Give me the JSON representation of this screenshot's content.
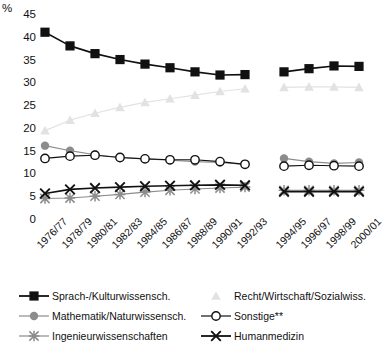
{
  "chart_data": {
    "type": "line",
    "title": "",
    "xlabel": "",
    "ylabel": "%",
    "ylim": [
      0,
      45
    ],
    "ytick_step": 5,
    "grid": false,
    "legend_position": "bottom",
    "note": "Series are broken between 1992/93 and 1994/95 (data gap)",
    "categories": [
      "1976/77",
      "1978/79",
      "1980/81",
      "1982/83",
      "1984/85",
      "1986/87",
      "1988/89",
      "1990/91",
      "1992/93",
      "1994/95",
      "1996/97",
      "1998/99",
      "2000/01"
    ],
    "yticks": [
      "0",
      "5",
      "10",
      "15",
      "20",
      "25",
      "30",
      "35",
      "40",
      "45"
    ],
    "series": [
      {
        "name": "Sprach-/Kulturwissensch.",
        "marker": "filled-square",
        "color": "#111111",
        "values": [
          41.0,
          38.0,
          36.3,
          35.0,
          34.0,
          33.2,
          32.3,
          31.6,
          31.7,
          32.3,
          33.0,
          33.6,
          33.5
        ]
      },
      {
        "name": "Recht/Wirtschaft/Sozialwiss.",
        "marker": "triangle",
        "color": "#e2e2e2",
        "values": [
          19.4,
          21.7,
          23.2,
          24.5,
          25.6,
          26.4,
          27.2,
          28.0,
          28.6,
          28.9,
          29.0,
          29.0,
          28.9
        ]
      },
      {
        "name": "Mathematik/Naturwissensch.",
        "marker": "filled-circle",
        "color": "#8c8c8c",
        "values": [
          16.1,
          15.0,
          14.1,
          13.5,
          13.2,
          12.9,
          12.6,
          12.4,
          12.0,
          13.3,
          12.6,
          12.2,
          12.4
        ]
      },
      {
        "name": "Sonstige**",
        "marker": "open-circle",
        "color": "#111111",
        "values": [
          13.3,
          13.8,
          14.0,
          13.5,
          13.2,
          13.0,
          13.0,
          12.6,
          12.0,
          11.6,
          11.8,
          11.7,
          11.6
        ]
      },
      {
        "name": "Ingenieurwissenschaften",
        "marker": "asterisk",
        "color": "#8c8c8c",
        "values": [
          4.5,
          4.6,
          5.0,
          5.4,
          5.9,
          6.3,
          6.6,
          6.8,
          7.0,
          6.3,
          6.3,
          6.3,
          6.3
        ]
      },
      {
        "name": "Humanmedizin",
        "marker": "cross",
        "color": "#111111",
        "values": [
          5.6,
          6.5,
          6.8,
          7.0,
          7.2,
          7.3,
          7.4,
          7.5,
          7.4,
          6.0,
          6.0,
          6.0,
          6.0
        ]
      }
    ]
  },
  "legend": {
    "items": [
      {
        "label": "Sprach-/Kulturwissensch.",
        "marker": "filled-square",
        "color": "#111111"
      },
      {
        "label": "Recht/Wirtschaft/Sozialwiss.",
        "marker": "triangle",
        "color": "#e2e2e2"
      },
      {
        "label": "Mathematik/Naturwissensch.",
        "marker": "filled-circle",
        "color": "#8c8c8c"
      },
      {
        "label": "Sonstige**",
        "marker": "open-circle",
        "color": "#111111"
      },
      {
        "label": "Ingenieurwissenschaften",
        "marker": "asterisk",
        "color": "#8c8c8c"
      },
      {
        "label": "Humanmedizin",
        "marker": "cross",
        "color": "#111111"
      }
    ]
  }
}
